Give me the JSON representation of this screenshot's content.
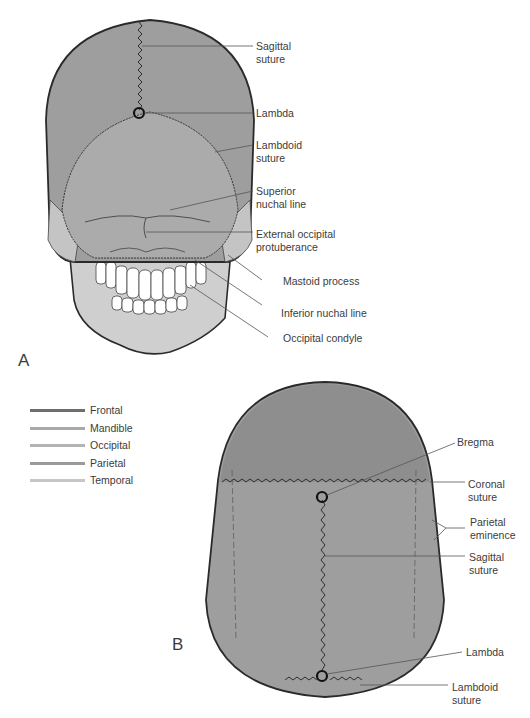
{
  "panel_a": {
    "letter": "A",
    "labels": [
      {
        "id": "sagittal-suture",
        "text": "Sagittal\nsuture"
      },
      {
        "id": "lambda",
        "text": "Lambda"
      },
      {
        "id": "lambdoid-suture",
        "text": "Lambdoid\nsuture"
      },
      {
        "id": "superior-nuchal-line",
        "text": "Superior\nnuchal line"
      },
      {
        "id": "external-occipital-protuberance",
        "text": "External occipital\nprotuberance"
      },
      {
        "id": "mastoid-process",
        "text": "Mastoid process"
      },
      {
        "id": "inferior-nuchal-line",
        "text": "Inferior nuchal line"
      },
      {
        "id": "occipital-condyle",
        "text": "Occipital condyle"
      }
    ]
  },
  "panel_b": {
    "letter": "B",
    "labels": [
      {
        "id": "bregma",
        "text": "Bregma"
      },
      {
        "id": "coronal-suture",
        "text": "Coronal\nsuture"
      },
      {
        "id": "parietal-eminence",
        "text": "Parietal\neminence"
      },
      {
        "id": "sagittal-suture",
        "text": "Sagittal\nsuture"
      },
      {
        "id": "lambda",
        "text": "Lambda"
      },
      {
        "id": "lambdoid-suture",
        "text": "Lambdoid\nsuture"
      }
    ]
  },
  "legend": {
    "items": [
      {
        "label": "Frontal",
        "color": "#6e6e6e"
      },
      {
        "label": "Mandible",
        "color": "#a9a9a9"
      },
      {
        "label": "Occipital",
        "color": "#b3b3b3"
      },
      {
        "label": "Parietal",
        "color": "#9a9a9a"
      },
      {
        "label": "Temporal",
        "color": "#c6c6c6"
      }
    ]
  },
  "colors": {
    "parietal": "#9e9e9e",
    "occipital": "#ababab",
    "frontal": "#8e8e8e",
    "temporal": "#c4c4c4",
    "mandible": "#cfcfcf",
    "outline": "#2a2a2a",
    "leader": "#555555"
  }
}
